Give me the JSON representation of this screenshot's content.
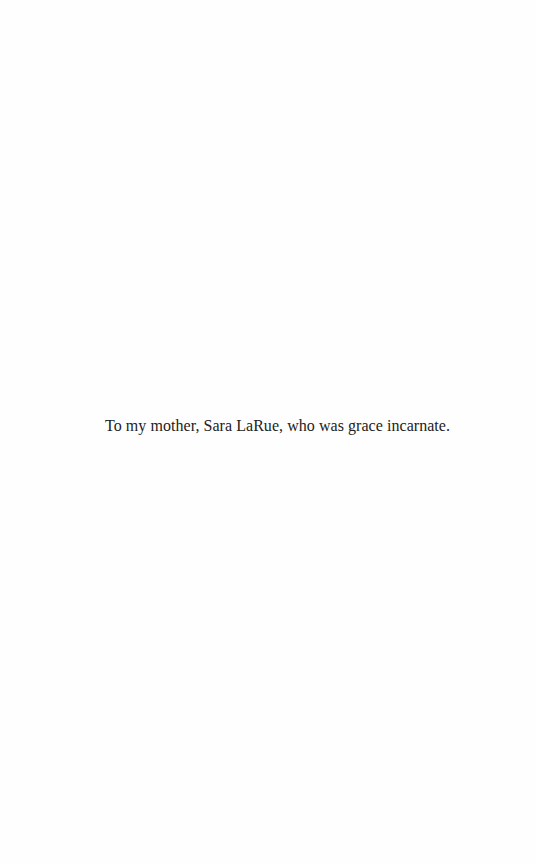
{
  "page": {
    "type": "dedication",
    "dedication_text": "To my mother, Sara LaRue, who was grace incarnate."
  },
  "colors": {
    "background": "#fefefe",
    "text": "#222222"
  }
}
